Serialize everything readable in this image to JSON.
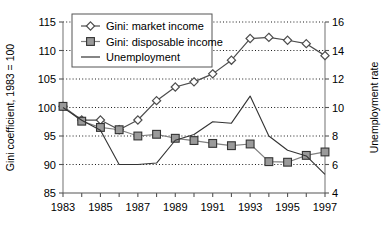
{
  "chart_data": {
    "type": "line",
    "title": "",
    "xlabel": "",
    "ylabel": "Gini coefficient, 1983 = 100",
    "y2label": "Unemployment rate",
    "x": [
      1983,
      1984,
      1985,
      1986,
      1987,
      1988,
      1989,
      1990,
      1991,
      1992,
      1993,
      1994,
      1995,
      1996,
      1997
    ],
    "xlim": [
      1983,
      1997
    ],
    "ylim": [
      85,
      115
    ],
    "y2lim": [
      4,
      16
    ],
    "xticks": [
      1983,
      1984,
      1985,
      1986,
      1987,
      1988,
      1989,
      1990,
      1991,
      1992,
      1993,
      1994,
      1995,
      1996,
      1997
    ],
    "xtick_labels": [
      "1983",
      "",
      "1985",
      "",
      "1987",
      "",
      "1989",
      "",
      "1991",
      "",
      "1993",
      "",
      "1995",
      "",
      "1997"
    ],
    "yticks": [
      85,
      90,
      95,
      100,
      105,
      110,
      115
    ],
    "ytick_labels": [
      "85",
      "90",
      "95",
      "100",
      "105",
      "110",
      "115"
    ],
    "y2ticks": [
      4,
      6,
      8,
      10,
      12,
      14,
      16
    ],
    "y2tick_labels": [
      "4",
      "6",
      "8",
      "10",
      "12",
      "14",
      "16"
    ],
    "grid": "horizontal-dotted",
    "legend_position": "top-left-inside",
    "series": [
      {
        "name": "Gini: market income",
        "axis": "left",
        "marker": "diamond-open",
        "color": "#4d4d4d",
        "values": [
          100.2,
          97.8,
          97.8,
          96.1,
          97.8,
          101.2,
          103.6,
          104.5,
          105.9,
          108.3,
          112.1,
          112.3,
          111.8,
          111.2,
          109.1
        ]
      },
      {
        "name": "Gini: disposable income",
        "axis": "left",
        "marker": "square-filled",
        "color": "#808080",
        "values": [
          100.2,
          97.6,
          96.5,
          96.1,
          95.0,
          95.3,
          94.6,
          94.2,
          93.7,
          93.3,
          93.6,
          90.5,
          90.4,
          91.6,
          92.2
        ]
      },
      {
        "name": "Unemployment",
        "axis": "right",
        "marker": "none",
        "color": "#333333",
        "values": [
          10.0,
          9.1,
          8.4,
          6.0,
          6.0,
          6.1,
          7.7,
          8.1,
          9.0,
          8.9,
          10.8,
          8.0,
          7.0,
          6.6,
          5.3
        ]
      }
    ]
  },
  "legend": {
    "items": [
      {
        "label": "Gini: market income"
      },
      {
        "label": "Gini: disposable income"
      },
      {
        "label": "Unemployment"
      }
    ]
  }
}
